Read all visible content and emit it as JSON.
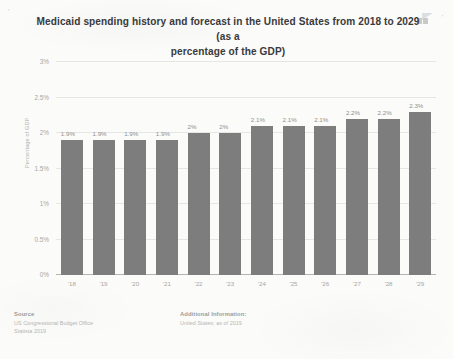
{
  "chart_data": {
    "type": "bar",
    "title": "Medicaid spending history and forecast in the United States from 2018 to 2029 (as a percentage of the GDP)",
    "title_line_1": "Medicaid spending history and forecast in the United States from 2018 to 2029 (as a",
    "title_line_2": "percentage of the GDP)",
    "xlabel": "",
    "ylabel": "Percentage of GDP",
    "categories": [
      "'18",
      "'19",
      "'20",
      "'21",
      "'22",
      "'23",
      "'24",
      "'25",
      "'26",
      "'27",
      "'28",
      "'29"
    ],
    "values": [
      1.9,
      1.9,
      1.9,
      1.9,
      2.0,
      2.0,
      2.1,
      2.1,
      2.1,
      2.2,
      2.2,
      2.3
    ],
    "value_labels": [
      "1.9%",
      "1.9%",
      "1.9%",
      "1.9%",
      "2%",
      "2%",
      "2.1%",
      "2.1%",
      "2.1%",
      "2.2%",
      "2.2%",
      "2.3%"
    ],
    "ylim": [
      0,
      3
    ],
    "yticks": [
      0,
      0.5,
      1,
      1.5,
      2,
      2.5,
      3
    ],
    "ytick_labels": [
      "0%",
      "0.5%",
      "1%",
      "1.5%",
      "2%",
      "2.5%",
      "3%"
    ],
    "grid": true,
    "legend": "none",
    "bar_color": "#7d7d7d",
    "background_color": "#fbfbfa"
  },
  "footer": {
    "source_heading": "Source",
    "source_lines": [
      "US Congressional Budget Office",
      "Statista 2019"
    ],
    "additional_heading": "Additional Information:",
    "additional_lines": [
      "United States; as of 2019"
    ]
  },
  "marks": {
    "left_tick": "'",
    "right_tick": "'"
  }
}
